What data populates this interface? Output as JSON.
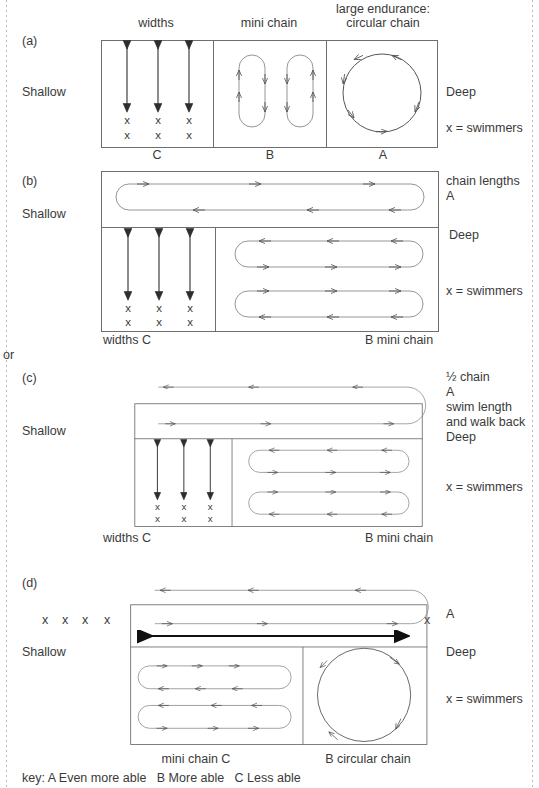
{
  "figure": {
    "headers": {
      "widths": "widths",
      "mini_chain": "mini chain",
      "large_endurance_line1": "large endurance:",
      "large_endurance_line2": "circular chain"
    },
    "or_connector": "or",
    "key": "key: A Even more able   B More able   C Less able",
    "panels": [
      {
        "id": "a",
        "tag": "(a)",
        "left_label": "Shallow",
        "right_labels": [
          "Deep",
          "x = swimmers"
        ],
        "bottom_labels": [
          "C",
          "B",
          "A"
        ],
        "swimmer_mark": "x"
      },
      {
        "id": "b",
        "tag": "(b)",
        "left_label": "Shallow",
        "right_labels": [
          "chain lengths",
          "A",
          "Deep",
          "x = swimmers"
        ],
        "bottom_labels": [
          "widths C",
          "B mini chain"
        ],
        "swimmer_mark": "x"
      },
      {
        "id": "c",
        "tag": "(c)",
        "left_label": "Shallow",
        "right_labels": [
          "½ chain",
          "A",
          "swim length",
          "and walk back",
          "Deep",
          "x = swimmers"
        ],
        "bottom_labels": [
          "widths C",
          "B mini chain"
        ],
        "swimmer_mark": "x"
      },
      {
        "id": "d",
        "tag": "(d)",
        "left_label": "Shallow",
        "right_labels": [
          "A",
          "Deep",
          "x = swimmers"
        ],
        "bottom_labels": [
          "mini chain C",
          "B circular chain"
        ],
        "swimmer_mark": "x",
        "queue_marks": [
          "x",
          "x",
          "x",
          "x"
        ],
        "end_mark": "x"
      }
    ],
    "colors": {
      "text": "#3a3a3a",
      "pool_border": "#6e6e6e",
      "lane_stroke": "#8a8a8a",
      "bold_arrow": "#111111",
      "page_edge": "#b9b9b9"
    }
  }
}
